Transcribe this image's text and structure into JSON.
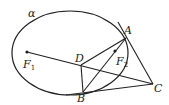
{
  "diagram": {
    "curve_label": "α",
    "points": {
      "F1": {
        "label": "F",
        "sub": "1"
      },
      "F2": {
        "label": "F",
        "sub": "2"
      },
      "A": {
        "label": "A"
      },
      "B": {
        "label": "B"
      },
      "C": {
        "label": "C"
      },
      "D": {
        "label": "D"
      }
    },
    "colors": {
      "stroke": "#222222",
      "background": "#ffffff"
    }
  }
}
